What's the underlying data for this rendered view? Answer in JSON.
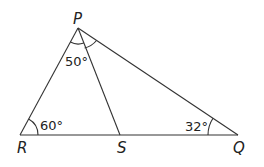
{
  "diagram": {
    "type": "triangle",
    "vertices": {
      "P": {
        "label": "P",
        "x": 78,
        "y": 28
      },
      "R": {
        "label": "R",
        "x": 20,
        "y": 135
      },
      "S": {
        "label": "S",
        "x": 120,
        "y": 135
      },
      "Q": {
        "label": "Q",
        "x": 238,
        "y": 135
      }
    },
    "segments": [
      "PR",
      "PQ",
      "RQ",
      "PS"
    ],
    "angles": {
      "RPS": "50°",
      "PRS": "60°",
      "PQR": "32°"
    },
    "colors": {
      "stroke": "#333333",
      "text": "#222222",
      "background": "#ffffff"
    }
  }
}
